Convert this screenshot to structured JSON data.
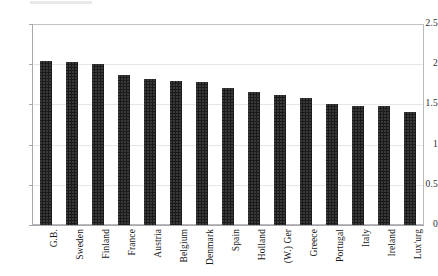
{
  "chart_data": {
    "type": "bar",
    "title": "",
    "subtitle": "",
    "xlabel": "",
    "ylabel": "",
    "ylim": [
      0,
      2.5
    ],
    "yticks": [
      0,
      0.5,
      1,
      1.5,
      2,
      2.5
    ],
    "ytick_labels": [
      "0",
      "0.5",
      "1",
      "1.5",
      "2",
      "2.5"
    ],
    "grid": true,
    "legend": "none",
    "orientation": "vertical",
    "bar_color": "#1b1b1b",
    "categories": [
      "G.B.",
      "Sweden",
      "Finland",
      "France",
      "Austria",
      "Belgium",
      "Denmark",
      "Spain",
      "Holland",
      "(W.) Ger",
      "Greece",
      "Portugal",
      "Italy",
      "Ireland",
      "Lux'urg"
    ],
    "values": [
      2.04,
      2.03,
      2.0,
      1.86,
      1.81,
      1.79,
      1.78,
      1.71,
      1.65,
      1.62,
      1.58,
      1.5,
      1.48,
      1.48,
      1.4
    ]
  }
}
